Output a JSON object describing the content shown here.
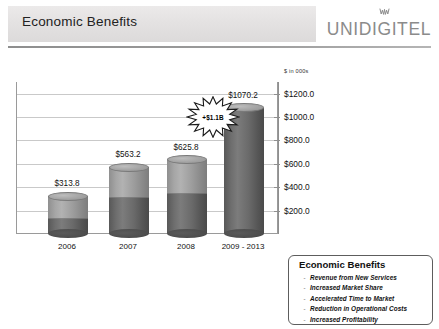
{
  "header": {
    "title": "Economic Benefits",
    "logo_text": "UNIDIGITEL",
    "logo_icon": "crown-icon"
  },
  "chart_data": {
    "type": "bar",
    "title": "Economic Benefits",
    "categories": [
      "2006",
      "2007",
      "2008",
      "2009 - 2013"
    ],
    "values": [
      313.8,
      563.2,
      625.8,
      1070.2
    ],
    "value_labels": [
      "$313.8",
      "$563.2",
      "$625.8",
      "$1070.2"
    ],
    "series": [
      {
        "name": "lower-segment",
        "values": [
          120.0,
          300.0,
          330.0,
          1070.2
        ]
      },
      {
        "name": "upper-segment",
        "values": [
          193.8,
          263.2,
          295.8,
          0.0
        ]
      }
    ],
    "xlabel": "",
    "ylabel": "",
    "yunit": "$ in 000s",
    "ylim": [
      0,
      1300
    ],
    "yticks": [
      200,
      400,
      600,
      800,
      1000,
      1200
    ],
    "ytick_labels": [
      "$200.0",
      "$400.0",
      "$600.0",
      "$800.0",
      "$1000.0",
      "$1200.0"
    ],
    "grid": true,
    "axis_position": "right",
    "legend": "none",
    "annotations": [
      {
        "name": "starburst-callout",
        "text": "+$1.1B",
        "target_category": "2009 - 2013"
      }
    ]
  },
  "callout": {
    "title": "Economic Benefits",
    "bullet": "-",
    "items": [
      "Revenue from New Services",
      "Increased Market Share",
      "Accelerated Time to Market",
      "Reduction in Operational Costs",
      "Increased Profitability"
    ]
  }
}
